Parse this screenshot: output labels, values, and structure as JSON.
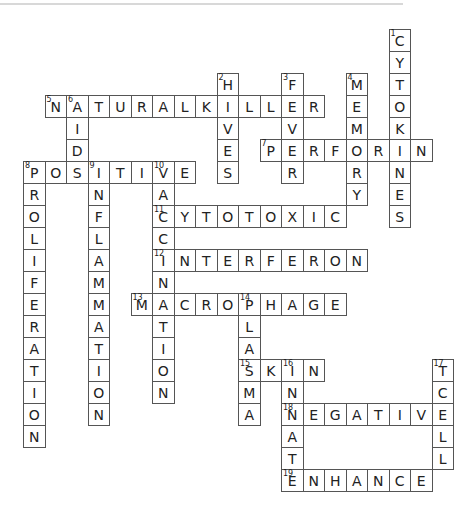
{
  "puzzle": {
    "type": "crossword",
    "grid_origin": {
      "x": 23,
      "y": 29,
      "col_width": 21.5,
      "row_height": 22
    },
    "words": [
      {
        "number": 1,
        "answer": "CYTOKINES",
        "direction": "down",
        "row": 0,
        "col": 17
      },
      {
        "number": 2,
        "answer": "HIVES",
        "direction": "down",
        "row": 2,
        "col": 9
      },
      {
        "number": 3,
        "answer": "FEVER",
        "direction": "down",
        "row": 2,
        "col": 12
      },
      {
        "number": 4,
        "answer": "MEMORY",
        "direction": "down",
        "row": 2,
        "col": 15
      },
      {
        "number": 5,
        "answer": "NATURALKILLER",
        "direction": "across",
        "row": 3,
        "col": 1
      },
      {
        "number": 6,
        "answer": "AID",
        "direction": "down",
        "row": 3,
        "col": 2
      },
      {
        "number": 7,
        "answer": "PERFORIN",
        "direction": "across",
        "row": 5,
        "col": 11
      },
      {
        "number": 8,
        "answer": "POSITIVE",
        "direction": "across",
        "row": 6,
        "col": 0
      },
      {
        "number": 8,
        "answer": "PROLIFERATION",
        "direction": "down",
        "row": 6,
        "col": 0
      },
      {
        "number": 9,
        "answer": "INFLAMMATION",
        "direction": "down",
        "row": 6,
        "col": 3
      },
      {
        "number": 10,
        "answer": "VACCINATION",
        "direction": "down",
        "row": 6,
        "col": 6
      },
      {
        "number": 11,
        "answer": "CYTOTOXIC",
        "direction": "across",
        "row": 8,
        "col": 6
      },
      {
        "number": 12,
        "answer": "INTERFERON",
        "direction": "across",
        "row": 10,
        "col": 6
      },
      {
        "number": 13,
        "answer": "MACROPHAGE",
        "direction": "across",
        "row": 12,
        "col": 5
      },
      {
        "number": 14,
        "answer": "PLASMA",
        "direction": "down",
        "row": 12,
        "col": 10
      },
      {
        "number": 15,
        "answer": "SKIN",
        "direction": "across",
        "row": 15,
        "col": 10
      },
      {
        "number": 16,
        "answer": "INNATE",
        "direction": "down",
        "row": 15,
        "col": 12
      },
      {
        "number": 17,
        "answer": "TCELL",
        "direction": "down",
        "row": 15,
        "col": 19
      },
      {
        "number": 18,
        "answer": "NEGATIVE",
        "direction": "across",
        "row": 17,
        "col": 12
      },
      {
        "number": 19,
        "answer": "ENHANCE",
        "direction": "across",
        "row": 20,
        "col": 12
      }
    ]
  },
  "colors": {
    "border": "#555555",
    "text": "#222222",
    "rule": "#d8d8d8",
    "background": "#ffffff"
  }
}
